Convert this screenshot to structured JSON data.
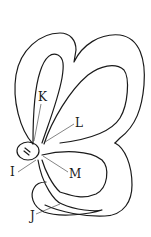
{
  "figure": {
    "stroke_color": "#1a1a1a",
    "background": "#ffffff",
    "labels": [
      {
        "id": "K",
        "text": "K",
        "x": 38,
        "y": 101
      },
      {
        "id": "L",
        "text": "L",
        "x": 75,
        "y": 127
      },
      {
        "id": "I",
        "text": "I",
        "x": 10,
        "y": 176
      },
      {
        "id": "M",
        "text": "M",
        "x": 69,
        "y": 178
      },
      {
        "id": "J",
        "text": "J",
        "x": 30,
        "y": 220
      }
    ]
  }
}
